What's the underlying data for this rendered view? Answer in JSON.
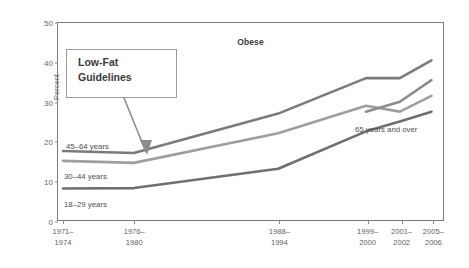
{
  "chart_data": {
    "type": "line",
    "title": "Obese",
    "xlabel": "",
    "ylabel": "Percent",
    "ylim": [
      0,
      50
    ],
    "yticks": [
      0,
      10,
      20,
      30,
      40,
      50
    ],
    "grid": false,
    "legend_position": "inline-labels",
    "categories": [
      "1971-1974",
      "1976-1980",
      "1988-1994",
      "1999-2000",
      "2001-2002",
      "2005-2006"
    ],
    "xtick_labels": [
      {
        "line1": "1971–",
        "line2": "1974"
      },
      {
        "line1": "1976–",
        "line2": "1980"
      },
      {
        "line1": "1988–",
        "line2": "1994"
      },
      {
        "line1": "1999–",
        "line2": "2000"
      },
      {
        "line1": "2001–",
        "line2": "2002"
      },
      {
        "line1": "2005–",
        "line2": "2006"
      }
    ],
    "series": [
      {
        "name": "18–29 years",
        "color": "#6f6f6f",
        "values": [
          8.0,
          8.1,
          13.0,
          22.5,
          25.0,
          27.5
        ]
      },
      {
        "name": "30–44 years",
        "color": "#9e9e9e",
        "values": [
          15.0,
          14.5,
          22.0,
          29.0,
          27.5,
          31.5
        ]
      },
      {
        "name": "45–64 years",
        "color": "#7b7b7b",
        "values": [
          17.5,
          17.0,
          27.0,
          36.0,
          36.0,
          40.5
        ]
      },
      {
        "name": "65 years and over",
        "color": "#8c8c8c",
        "values": [
          null,
          null,
          null,
          27.5,
          30.0,
          35.5
        ]
      }
    ],
    "series_labels": [
      {
        "text": "45–64 years",
        "x": 66,
        "y": 142
      },
      {
        "text": "30–44 years",
        "x": 64,
        "y": 172
      },
      {
        "text": "18–29 years",
        "x": 64,
        "y": 200
      },
      {
        "text": "65 years and over",
        "x": 355,
        "y": 125
      }
    ],
    "annotations": [
      {
        "name": "low-fat-guidelines",
        "line1": "Low-Fat",
        "line2": "Guidelines",
        "points_to_category": "1976–1980"
      }
    ]
  }
}
